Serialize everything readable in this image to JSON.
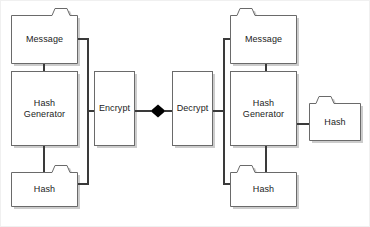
{
  "diagram": {
    "type": "flow-diagram",
    "background_color": "#ffffff",
    "stroke_color": "#555555",
    "shadow_color": "#c8c8c8",
    "text_color": "#1c1c1c",
    "connector_color": "#000000",
    "nodes": {
      "left_message": {
        "label": "Message",
        "shape": "folder",
        "tab_side": "right"
      },
      "left_hash_generator": {
        "label": "Hash\nGenerator",
        "shape": "rectangle"
      },
      "left_hash": {
        "label": "Hash",
        "shape": "folder",
        "tab_side": "right"
      },
      "encrypt": {
        "label": "Encrypt",
        "shape": "rectangle"
      },
      "connector": {
        "label": "",
        "shape": "diamond"
      },
      "decrypt": {
        "label": "Decrypt",
        "shape": "rectangle"
      },
      "right_message": {
        "label": "Message",
        "shape": "folder",
        "tab_side": "left"
      },
      "right_hash_generator": {
        "label": "Hash\nGenerator",
        "shape": "rectangle"
      },
      "right_hash_out": {
        "label": "Hash",
        "shape": "folder",
        "tab_side": "left"
      },
      "right_hash": {
        "label": "Hash",
        "shape": "folder",
        "tab_side": "left"
      }
    },
    "edges": [
      {
        "from": "left_message",
        "to": "left_hash_generator"
      },
      {
        "from": "left_hash_generator",
        "to": "left_hash"
      },
      {
        "from": "left_message",
        "to": "encrypt"
      },
      {
        "from": "left_hash",
        "to": "encrypt"
      },
      {
        "from": "encrypt",
        "to": "connector"
      },
      {
        "from": "connector",
        "to": "decrypt"
      },
      {
        "from": "decrypt",
        "to": "right_message"
      },
      {
        "from": "decrypt",
        "to": "right_hash"
      },
      {
        "from": "right_message",
        "to": "right_hash_generator"
      },
      {
        "from": "right_hash_generator",
        "to": "right_hash"
      },
      {
        "from": "right_hash_generator",
        "to": "right_hash_out"
      }
    ]
  }
}
